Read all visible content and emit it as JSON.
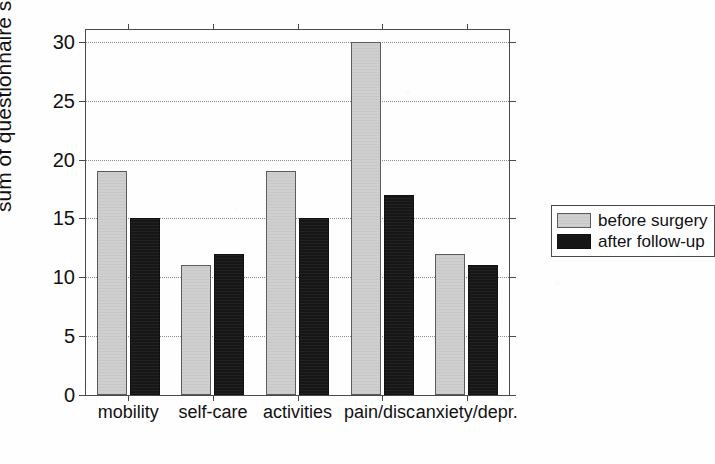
{
  "chart_data": {
    "type": "bar",
    "title": "",
    "xlabel": "",
    "ylabel": "sum of questionnaire scores",
    "ylim": [
      0,
      31
    ],
    "yticks": [
      0,
      5,
      10,
      15,
      20,
      25,
      30
    ],
    "ytick_labels": [
      "0",
      "5",
      "10",
      "15",
      "20",
      "25",
      "30"
    ],
    "grid": "horizontal-dotted",
    "legend_position": "right",
    "categories": [
      "mobility",
      "self-care",
      "activities",
      "pain/disc.",
      "anxiety/depr."
    ],
    "series": [
      {
        "name": "before surgery",
        "color": "#cfcfcf",
        "values": [
          19,
          11,
          19,
          30,
          12
        ]
      },
      {
        "name": "after follow-up",
        "color": "#161616",
        "values": [
          15,
          12,
          15,
          17,
          11
        ]
      }
    ]
  },
  "legend": {
    "entries": [
      {
        "label": "before surgery",
        "swatch": "light-gray-swatch"
      },
      {
        "label": "after follow-up",
        "swatch": "black-swatch"
      }
    ]
  },
  "axes": {
    "y_title": "sum of questionnaire scores",
    "y_tick_labels": [
      "0",
      "5",
      "10",
      "15",
      "20",
      "25",
      "30"
    ],
    "x_tick_labels": [
      "mobility",
      "self-care",
      "activities",
      "pain/disc.",
      "anxiety/depr."
    ]
  },
  "colors": {
    "before_surgery": "#cfcfcf",
    "after_follow_up": "#161616",
    "axis": "#4a4a4a",
    "grid": "#8d8d8d",
    "background": "#fefefe"
  }
}
